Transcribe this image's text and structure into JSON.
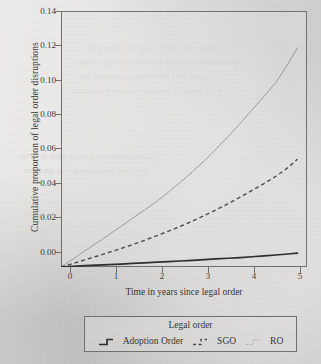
{
  "figure": {
    "background_color": "#d3d2d0",
    "frame_color": "#6f6e6c"
  },
  "axes": {
    "y_title": "Cumulative proportion of legal order disruptions",
    "x_title": "Time in years since legal order",
    "y_ticks": [
      "0.00",
      "0.02",
      "0.04",
      "0.06",
      "0.08",
      "0.10",
      "0.12",
      "0.14"
    ],
    "x_ticks": [
      "0",
      "1",
      "2",
      "3",
      "4",
      "5"
    ]
  },
  "legend": {
    "title": "Legal order",
    "entries": [
      {
        "label": "Adoption Order",
        "style": "solid",
        "color": "#2b2b2b",
        "key_icon": "solid-step-line-icon"
      },
      {
        "label": "SGO",
        "style": "dashed",
        "color": "#4a4a4a",
        "key_icon": "dashed-step-line-icon"
      },
      {
        "label": "RO",
        "style": "dotted",
        "color": "#9a9a98",
        "key_icon": "dotted-step-line-icon"
      }
    ]
  },
  "chart_data": {
    "type": "line",
    "title": "",
    "xlabel": "Time in years since legal order",
    "ylabel": "Cumulative proportion of legal order disruptions",
    "xlim": [
      0,
      5.15
    ],
    "ylim": [
      0,
      0.1495
    ],
    "grid": false,
    "legend_position": "bottom",
    "x": [
      0,
      0.25,
      0.5,
      0.75,
      1,
      1.25,
      1.5,
      1.75,
      2,
      2.25,
      2.5,
      2.75,
      3,
      3.25,
      3.5,
      3.75,
      4,
      4.25,
      4.5,
      4.75,
      4.95
    ],
    "series": [
      {
        "name": "Adoption Order",
        "color": "#2b2b2b",
        "style": "solid",
        "values": [
          0.0,
          0.0004,
          0.0008,
          0.0011,
          0.0014,
          0.0017,
          0.0021,
          0.0024,
          0.0028,
          0.0031,
          0.0035,
          0.0039,
          0.0043,
          0.0047,
          0.0051,
          0.0055,
          0.006,
          0.0065,
          0.007,
          0.0076,
          0.0081
        ]
      },
      {
        "name": "SGO",
        "color": "#4a4a4a",
        "style": "dashed",
        "values": [
          0.0,
          0.002,
          0.0042,
          0.0063,
          0.0085,
          0.0107,
          0.0131,
          0.0156,
          0.0182,
          0.0209,
          0.0238,
          0.0268,
          0.03,
          0.0334,
          0.037,
          0.0408,
          0.0447,
          0.0487,
          0.053,
          0.058,
          0.063
        ]
      },
      {
        "name": "RO",
        "color": "#9a9a98",
        "style": "dotted",
        "values": [
          0.0,
          0.0046,
          0.0094,
          0.014,
          0.0188,
          0.0236,
          0.0285,
          0.0333,
          0.0382,
          0.0437,
          0.0495,
          0.0556,
          0.062,
          0.069,
          0.0762,
          0.0838,
          0.0918,
          0.0996,
          0.1078,
          0.1186,
          0.128
        ]
      }
    ]
  }
}
